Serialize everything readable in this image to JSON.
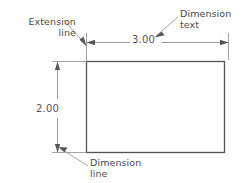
{
  "drawing": {
    "title": "Dimensioned rectangle CAD annotation diagram",
    "colors": {
      "object_line": "#555555",
      "dimension_line": "#8c8c8c",
      "extension_line": "#9a9a9a",
      "leader_line": "#9a9a9a",
      "text": "#4a4a4a",
      "background": "#ffffff"
    },
    "shape": {
      "name": "rectangle",
      "width_value": "3.00",
      "height_value": "2.00"
    },
    "dimensions": [
      {
        "id": "horizontal",
        "text": "3.00",
        "orientation": "horizontal",
        "position": "above"
      },
      {
        "id": "vertical",
        "text": "2.00",
        "orientation": "vertical",
        "position": "left"
      }
    ],
    "annotations": [
      {
        "id": "extension-line",
        "line1": "Extension",
        "line2": "line",
        "align": "right"
      },
      {
        "id": "dimension-text",
        "line1": "Dimension",
        "line2": "text",
        "align": "left"
      },
      {
        "id": "dimension-line",
        "line1": "Dimension",
        "line2": "line",
        "align": "left"
      }
    ]
  }
}
